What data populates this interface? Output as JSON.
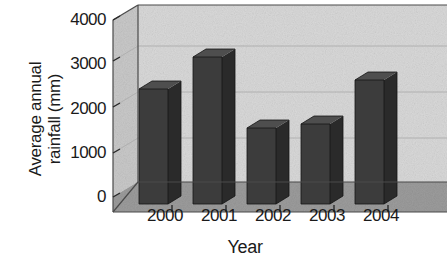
{
  "chart_data": {
    "type": "bar",
    "title": "",
    "subtitle": "",
    "xlabel": "Year",
    "ylabel": "Average annual\nrainfall (mm)",
    "categories": [
      "2000",
      "2001",
      "2002",
      "2003",
      "2004"
    ],
    "values": [
      2400,
      3100,
      1650,
      1750,
      2700
    ],
    "series": [
      {
        "name": "Average annual rainfall (mm)",
        "values": [
          2400,
          3100,
          1650,
          1750,
          2700
        ]
      }
    ],
    "ylim": [
      0,
      4000
    ],
    "yticks": [
      0,
      1000,
      2000,
      3000,
      4000
    ],
    "ytick_labels": [
      "0",
      "1000",
      "2000",
      "3000",
      "4000"
    ],
    "xtick_labels": [
      "2000",
      "2001",
      "2002",
      "2003",
      "2004"
    ],
    "grid": true,
    "grid_axis": "y",
    "legend": false,
    "legend_position": "none",
    "style": "3d-bar",
    "annotations": []
  },
  "colors": {
    "bar_front": "#3c3c3c",
    "bar_side": "#2a2a2a",
    "bar_top": "#4e4e4e",
    "back_wall": "#d9d9d9",
    "left_wall": "#c9c9c9",
    "floor": "#9c9c9c",
    "gridline": "#b0b0b0",
    "axis_line": "#4a4a4a",
    "text": "#1a1a1a",
    "page_background": "#ffffff"
  }
}
